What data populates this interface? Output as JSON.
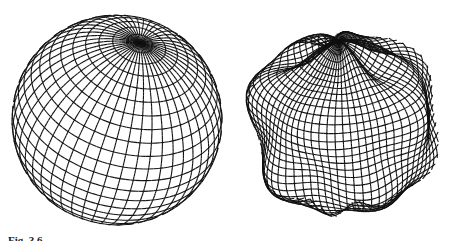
{
  "figure": {
    "panels": [
      {
        "id": "left",
        "label": "wireframe-sphere",
        "description": "Regular sphere rendered as latitude/longitude wireframe mesh"
      },
      {
        "id": "right",
        "label": "deformed-sphere",
        "description": "Sphere with undulating radial perturbations rendered as wireframe mesh"
      }
    ],
    "caption": {
      "label": "Fig. 3.6",
      "text": ""
    },
    "colors": {
      "line": "#111111",
      "background": "#ffffff"
    }
  }
}
